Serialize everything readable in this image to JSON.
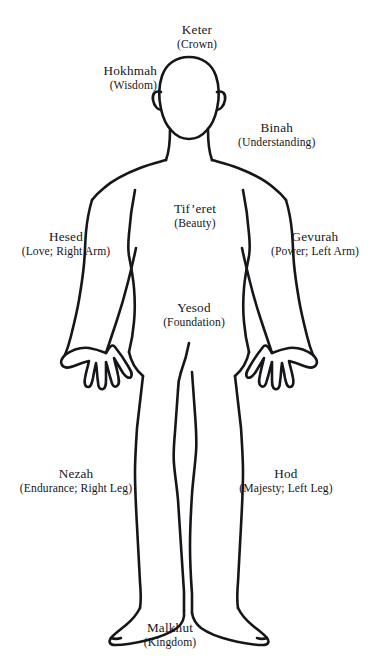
{
  "diagram": {
    "figure_name": "human-body-outline",
    "ink_color": "#16161a",
    "background_color": "#ffffff"
  },
  "labels": [
    {
      "key": "keter",
      "name": "Keter",
      "gloss": "(Crown)",
      "align": "ctr",
      "x": 197,
      "y": 22
    },
    {
      "key": "hokhmah",
      "name": "Hokhmah",
      "gloss": "(Wisdom)",
      "align": "rgt",
      "x": 157,
      "y": 63
    },
    {
      "key": "binah",
      "name": "Binah",
      "gloss": "(Understanding)",
      "align": "lft",
      "x": 238,
      "y": 120
    },
    {
      "key": "tiferet",
      "name": "Tif’eret",
      "gloss": "(Beauty)",
      "align": "ctr",
      "x": 195,
      "y": 201
    },
    {
      "key": "hesed",
      "name": "Hesed",
      "gloss": "(Love; Right Arm)",
      "align": "ctr",
      "x": 66,
      "y": 229
    },
    {
      "key": "gevurah",
      "name": "Gevurah",
      "gloss": "(Power; Left Arm)",
      "align": "ctr",
      "x": 315,
      "y": 229
    },
    {
      "key": "yesod",
      "name": "Yesod",
      "gloss": "(Foundation)",
      "align": "ctr",
      "x": 194,
      "y": 300
    },
    {
      "key": "nezah",
      "name": "Nezah",
      "gloss": "(Endurance; Right Leg)",
      "align": "ctr",
      "x": 76,
      "y": 466
    },
    {
      "key": "hod",
      "name": "Hod",
      "gloss": "(Majesty; Left Leg)",
      "align": "ctr",
      "x": 286,
      "y": 466
    },
    {
      "key": "malkhut",
      "name": "Malkhut",
      "gloss": "(Kingdom)",
      "align": "ctr",
      "x": 170,
      "y": 620
    }
  ]
}
